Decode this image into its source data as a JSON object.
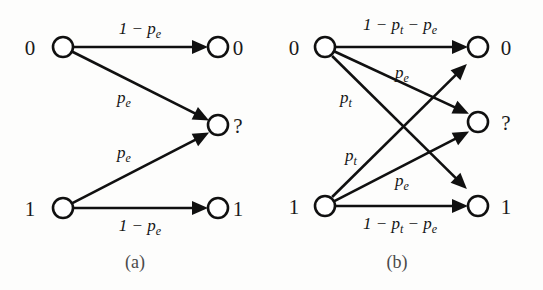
{
  "figure": {
    "background_color": "#fdfdfc",
    "stroke_color": "#101010",
    "caption_color": "#4a4a4a",
    "panels": [
      {
        "id": "panel-a",
        "caption": "(a)",
        "caption_pos": {
          "x": 135,
          "y": 268
        },
        "input_labels": [
          {
            "text": "0",
            "x": 30,
            "y": 55
          },
          {
            "text": "1",
            "x": 30,
            "y": 216
          }
        ],
        "output_labels": [
          {
            "text": "0",
            "x": 238,
            "y": 55
          },
          {
            "text": "?",
            "x": 238,
            "y": 133
          },
          {
            "text": "1",
            "x": 238,
            "y": 216
          }
        ],
        "nodes": [
          {
            "name": "input-node-0",
            "x": 63,
            "y": 47,
            "r": 10
          },
          {
            "name": "input-node-1",
            "x": 63,
            "y": 208,
            "r": 10
          },
          {
            "name": "output-node-0",
            "x": 218,
            "y": 47,
            "r": 10
          },
          {
            "name": "output-node-erasure",
            "x": 218,
            "y": 125,
            "r": 10
          },
          {
            "name": "output-node-1",
            "x": 218,
            "y": 208,
            "r": 10
          }
        ],
        "edges": [
          {
            "name": "edge-0-to-0",
            "from": "input-node-0",
            "to": "output-node-0",
            "x1": 63,
            "y1": 47,
            "x2": 218,
            "y2": 47,
            "label": "1 − p",
            "label_sub": "e",
            "label_x": 140,
            "label_y": 34
          },
          {
            "name": "edge-0-to-erasure",
            "from": "input-node-0",
            "to": "output-node-erasure",
            "x1": 63,
            "y1": 47,
            "x2": 218,
            "y2": 125,
            "label": "p",
            "label_sub": "e",
            "label_x": 124,
            "label_y": 103
          },
          {
            "name": "edge-1-to-erasure",
            "from": "input-node-1",
            "to": "output-node-erasure",
            "x1": 63,
            "y1": 208,
            "x2": 218,
            "y2": 128,
            "label": "p",
            "label_sub": "e",
            "label_x": 124,
            "label_y": 158
          },
          {
            "name": "edge-1-to-1",
            "from": "input-node-1",
            "to": "output-node-1",
            "x1": 63,
            "y1": 208,
            "x2": 218,
            "y2": 208,
            "label": "1 − p",
            "label_sub": "e",
            "label_x": 140,
            "label_y": 231
          }
        ]
      },
      {
        "id": "panel-b",
        "caption": "(b)",
        "caption_pos": {
          "x": 397,
          "y": 268
        },
        "input_labels": [
          {
            "text": "0",
            "x": 294,
            "y": 55
          },
          {
            "text": "1",
            "x": 294,
            "y": 214
          }
        ],
        "output_labels": [
          {
            "text": "0",
            "x": 506,
            "y": 55
          },
          {
            "text": "?",
            "x": 506,
            "y": 130
          },
          {
            "text": "1",
            "x": 506,
            "y": 214
          }
        ],
        "nodes": [
          {
            "name": "input-node-0",
            "x": 325,
            "y": 47,
            "r": 10
          },
          {
            "name": "input-node-1",
            "x": 325,
            "y": 206,
            "r": 10
          },
          {
            "name": "output-node-0",
            "x": 478,
            "y": 47,
            "r": 10
          },
          {
            "name": "output-node-erasure",
            "x": 478,
            "y": 122,
            "r": 10
          },
          {
            "name": "output-node-1",
            "x": 478,
            "y": 206,
            "r": 10
          }
        ],
        "edges": [
          {
            "name": "edge-0-to-0",
            "from": "input-node-0",
            "to": "output-node-0",
            "x1": 325,
            "y1": 47,
            "x2": 478,
            "y2": 47,
            "label": "1 − p",
            "label_sub": "t",
            "label2": " − p",
            "label_sub2": "e",
            "label_x": 400,
            "label_y": 30
          },
          {
            "name": "edge-0-to-erasure",
            "from": "input-node-0",
            "to": "output-node-erasure",
            "x1": 325,
            "y1": 47,
            "x2": 478,
            "y2": 118,
            "label": "p",
            "label_sub": "e",
            "label_x": 402,
            "label_y": 78
          },
          {
            "name": "edge-0-to-1",
            "from": "input-node-0",
            "to": "output-node-1",
            "x1": 325,
            "y1": 49,
            "x2": 474,
            "y2": 196,
            "label": "p",
            "label_sub": "t",
            "label_x": 346,
            "label_y": 103
          },
          {
            "name": "edge-1-to-0",
            "from": "input-node-1",
            "to": "output-node-0",
            "x1": 325,
            "y1": 204,
            "x2": 474,
            "y2": 57,
            "label": "p",
            "label_sub": "t",
            "label_x": 351,
            "label_y": 161
          },
          {
            "name": "edge-1-to-erasure",
            "from": "input-node-1",
            "to": "output-node-erasure",
            "x1": 325,
            "y1": 206,
            "x2": 478,
            "y2": 127,
            "label": "p",
            "label_sub": "e",
            "label_x": 402,
            "label_y": 186
          },
          {
            "name": "edge-1-to-1",
            "from": "input-node-1",
            "to": "output-node-1",
            "x1": 325,
            "y1": 206,
            "x2": 478,
            "y2": 206,
            "label": "1 − p",
            "label_sub": "t",
            "label2": " − p",
            "label_sub2": "e",
            "label_x": 400,
            "label_y": 229
          }
        ]
      }
    ]
  }
}
